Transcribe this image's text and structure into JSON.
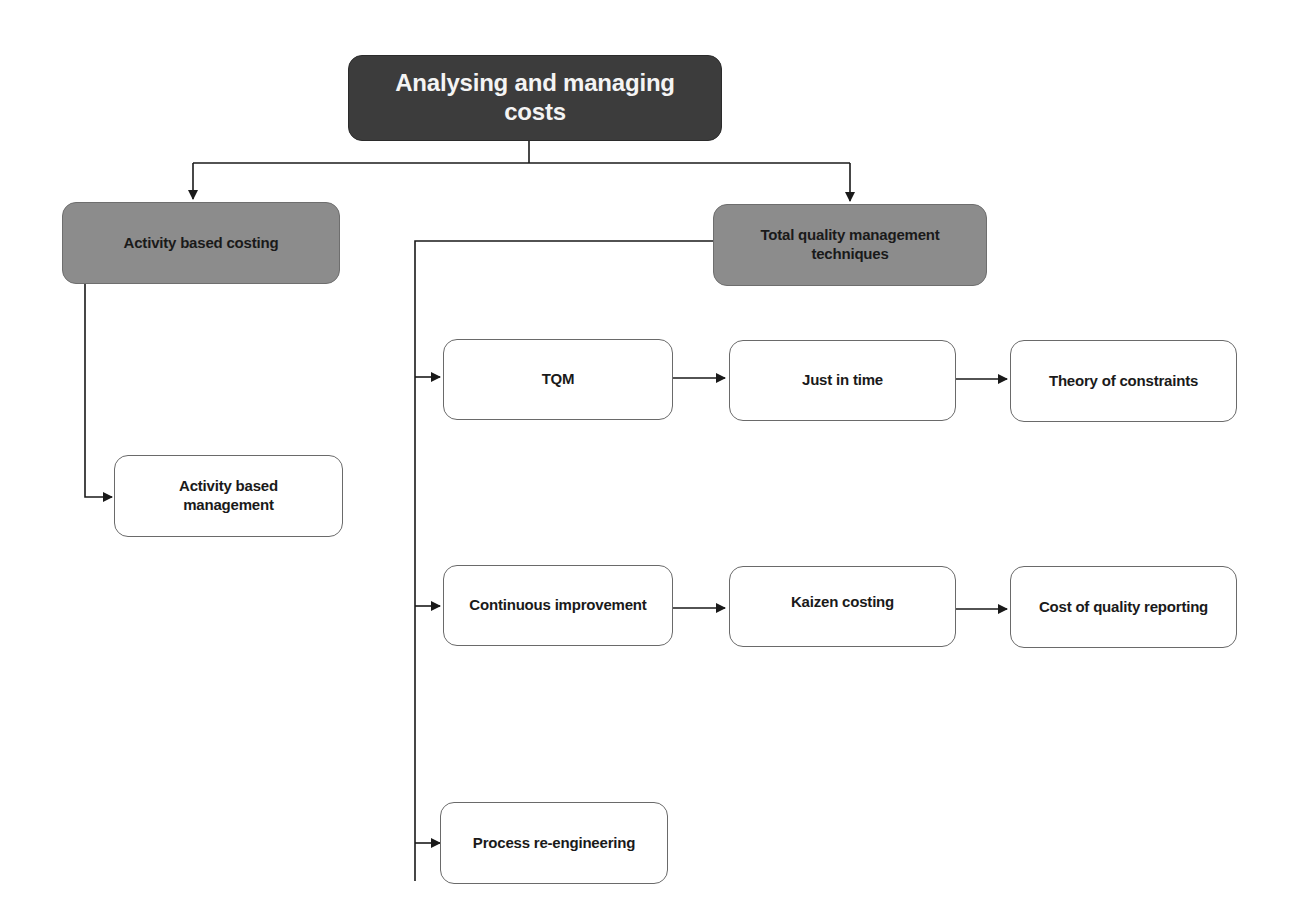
{
  "diagram": {
    "title": "Analysing and managing costs",
    "root": {
      "label": "Analysing and managing costs"
    },
    "categories": [
      {
        "id": "abc",
        "label": "Activity based costing"
      },
      {
        "id": "tqm_tech",
        "label": "Total quality management techniques"
      }
    ],
    "nodes": {
      "abm": {
        "label": "Activity based management"
      },
      "tqm": {
        "label": "TQM"
      },
      "jit": {
        "label": "Just in time"
      },
      "toc": {
        "label": "Theory of constraints"
      },
      "ci": {
        "label": "Continuous improvement"
      },
      "kaizen": {
        "label": "Kaizen costing"
      },
      "coq": {
        "label": "Cost of quality reporting"
      },
      "bpr": {
        "label": "Process re-engineering"
      }
    },
    "edges": [
      {
        "from": "Analysing and managing costs",
        "to": "Activity based costing"
      },
      {
        "from": "Analysing and managing costs",
        "to": "Total quality management techniques"
      },
      {
        "from": "Activity based costing",
        "to": "Activity based management"
      },
      {
        "from": "Total quality management techniques",
        "to": "TQM"
      },
      {
        "from": "Total quality management techniques",
        "to": "Continuous improvement"
      },
      {
        "from": "Total quality management techniques",
        "to": "Process re-engineering"
      },
      {
        "from": "TQM",
        "to": "Just in time"
      },
      {
        "from": "Just in time",
        "to": "Theory of constraints"
      },
      {
        "from": "Continuous improvement",
        "to": "Kaizen costing"
      },
      {
        "from": "Kaizen costing",
        "to": "Cost of quality reporting"
      }
    ],
    "colors": {
      "root_fill": "#3c3c3c",
      "root_text": "#f4f4f4",
      "category_fill": "#8c8c8c",
      "leaf_fill": "#ffffff",
      "line": "#1a1a1a"
    }
  }
}
